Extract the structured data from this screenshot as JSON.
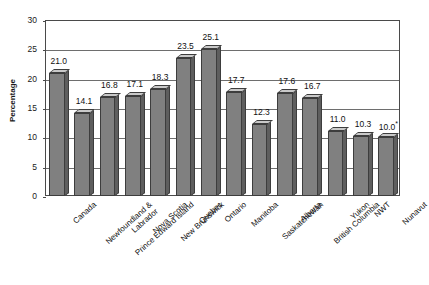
{
  "chart_data": {
    "type": "bar",
    "title": "",
    "subtitle": "",
    "xlabel": "",
    "ylabel": "Percentage",
    "ylim": [
      0,
      30
    ],
    "ytick_step": 5,
    "yticks": [
      "0",
      "5",
      "10",
      "15",
      "20",
      "25",
      "30"
    ],
    "grid": true,
    "legend": "none",
    "categories": [
      "Canada",
      "Newfoundland & Labrador",
      "Prince Edward Island",
      "Nova Scotia",
      "New Brunswick",
      "Quebec",
      "Ontario",
      "Manitoba",
      "Saskatchewan",
      "Alberta",
      "British Columbia",
      "Yukon",
      "NWT",
      "Nunavut"
    ],
    "values": [
      21.0,
      14.1,
      16.8,
      17.1,
      18.3,
      23.5,
      25.1,
      17.7,
      12.3,
      17.6,
      16.7,
      11.0,
      10.3,
      10.0
    ],
    "data_labels": [
      "21.0",
      "14.1",
      "16.8",
      "17.1",
      "18.3",
      "23.5",
      "25.1",
      "17.7",
      "12.3",
      "17.6",
      "16.7",
      "11.0",
      "10.3",
      "10.0"
    ],
    "annotations": [
      {
        "category": "Nunavut",
        "marker": "*",
        "note": "asterisk superscript on 10.0"
      }
    ],
    "colors": {
      "bar_front": "#808080",
      "bar_top": "#c9c9c9",
      "bar_side": "#5e5e5e",
      "bar_outline": "#3d3d3d",
      "gridline": "#6e6e6e",
      "frame": "#4a4a4a",
      "text": "#111111",
      "background": "#ffffff"
    }
  }
}
